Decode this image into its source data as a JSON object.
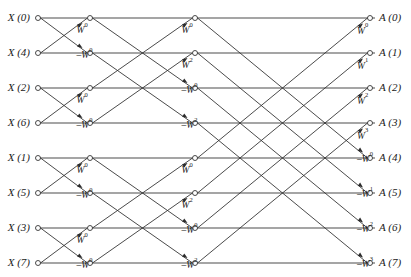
{
  "figure": {
    "kind": "fft-butterfly-signal-flow-graph",
    "stage_count": 3,
    "row_count": 8
  },
  "inputs": [
    {
      "label": "X (0)"
    },
    {
      "label": "X (4)"
    },
    {
      "label": "X (2)"
    },
    {
      "label": "X (6)"
    },
    {
      "label": "X (1)"
    },
    {
      "label": "X (5)"
    },
    {
      "label": "X (3)"
    },
    {
      "label": "X (7)"
    }
  ],
  "outputs": [
    {
      "label": "A (0)"
    },
    {
      "label": "A (1)"
    },
    {
      "label": "A (2)"
    },
    {
      "label": "A (3)"
    },
    {
      "label": "A (4)"
    },
    {
      "label": "A (5)"
    },
    {
      "label": "A (6)"
    },
    {
      "label": "A (7)"
    }
  ],
  "stage1_weights": [
    {
      "base": "W",
      "exp": "0",
      "sign": ""
    },
    {
      "base": "W",
      "exp": "0",
      "sign": "–"
    },
    {
      "base": "W",
      "exp": "0",
      "sign": ""
    },
    {
      "base": "W",
      "exp": "0",
      "sign": "–"
    },
    {
      "base": "W",
      "exp": "0",
      "sign": ""
    },
    {
      "base": "W",
      "exp": "0",
      "sign": "–"
    },
    {
      "base": "W",
      "exp": "0",
      "sign": ""
    },
    {
      "base": "W",
      "exp": "0",
      "sign": "–"
    }
  ],
  "stage2_weights": [
    {
      "base": "W",
      "exp": "0",
      "sign": ""
    },
    {
      "base": "W",
      "exp": "2",
      "sign": ""
    },
    {
      "base": "W",
      "exp": "0",
      "sign": "–"
    },
    {
      "base": "W",
      "exp": "2",
      "sign": "–"
    },
    {
      "base": "W",
      "exp": "0",
      "sign": ""
    },
    {
      "base": "W",
      "exp": "2",
      "sign": ""
    },
    {
      "base": "W",
      "exp": "0",
      "sign": "–"
    },
    {
      "base": "W",
      "exp": "2",
      "sign": "–"
    }
  ],
  "stage3_weights": [
    {
      "base": "W",
      "exp": "0",
      "sign": ""
    },
    {
      "base": "W",
      "exp": "1",
      "sign": ""
    },
    {
      "base": "W",
      "exp": "2",
      "sign": ""
    },
    {
      "base": "W",
      "exp": "3",
      "sign": ""
    },
    {
      "base": "W",
      "exp": "0",
      "sign": "–"
    },
    {
      "base": "W",
      "exp": "1",
      "sign": "–"
    },
    {
      "base": "W",
      "exp": "2",
      "sign": "–"
    },
    {
      "base": "W",
      "exp": "3",
      "sign": "–"
    }
  ],
  "geometry": {
    "columns": [
      38,
      90,
      195,
      370
    ],
    "rows": [
      18,
      53,
      88,
      123,
      158,
      193,
      228,
      263
    ],
    "input_label_x": 30,
    "output_label_x": 379
  },
  "colors": {
    "ink": "#2b2b2b",
    "text": "#1a1a1a",
    "background": "#ffffff"
  }
}
